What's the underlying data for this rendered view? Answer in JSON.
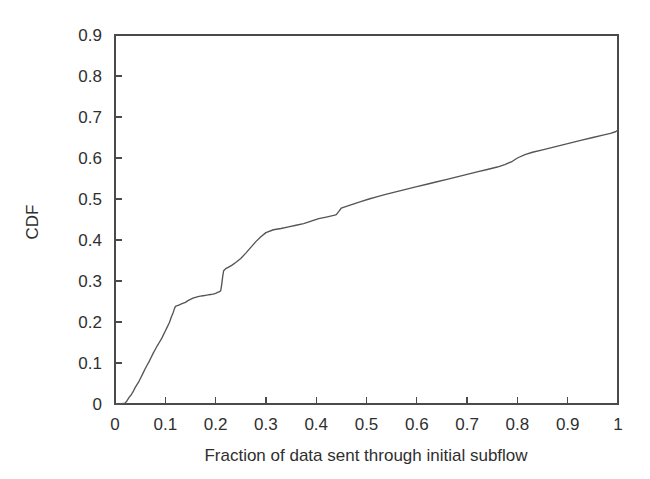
{
  "chart_data": {
    "type": "line",
    "title": "",
    "subtitle": "",
    "xlabel": "Fraction of data sent through initial subflow",
    "ylabel": "CDF",
    "xlim": [
      0,
      1
    ],
    "ylim": [
      0,
      0.9
    ],
    "grid": false,
    "legend": null,
    "legend_position": "none",
    "xticks": [
      0,
      0.1,
      0.2,
      0.3,
      0.4,
      0.5,
      0.6,
      0.7,
      0.8,
      0.9,
      1
    ],
    "xticklabels": [
      "0",
      "0.1",
      "0.2",
      "0.3",
      "0.4",
      "0.5",
      "0.6",
      "0.7",
      "0.8",
      "0.9",
      "1"
    ],
    "yticks": [
      0,
      0.1,
      0.2,
      0.3,
      0.4,
      0.5,
      0.6,
      0.7,
      0.8,
      0.9
    ],
    "yticklabels": [
      "0",
      "0.1",
      "0.2",
      "0.3",
      "0.4",
      "0.5",
      "0.6",
      "0.7",
      "0.8",
      "0.9"
    ],
    "series": [
      {
        "name": "CDF of fraction of data sent through initial subflow",
        "color": "#555555",
        "x": [
          0.0,
          0.01,
          0.02,
          0.024,
          0.028,
          0.032,
          0.036,
          0.04,
          0.044,
          0.048,
          0.052,
          0.056,
          0.06,
          0.064,
          0.068,
          0.072,
          0.076,
          0.08,
          0.084,
          0.088,
          0.092,
          0.096,
          0.1,
          0.104,
          0.108,
          0.112,
          0.116,
          0.118,
          0.12,
          0.124,
          0.128,
          0.132,
          0.136,
          0.14,
          0.145,
          0.15,
          0.155,
          0.16,
          0.165,
          0.17,
          0.175,
          0.18,
          0.185,
          0.19,
          0.195,
          0.2,
          0.204,
          0.208,
          0.21,
          0.212,
          0.214,
          0.216,
          0.22,
          0.226,
          0.232,
          0.24,
          0.25,
          0.26,
          0.27,
          0.28,
          0.29,
          0.3,
          0.315,
          0.33,
          0.345,
          0.36,
          0.375,
          0.39,
          0.405,
          0.42,
          0.435,
          0.44,
          0.445,
          0.45,
          0.46,
          0.475,
          0.49,
          0.505,
          0.52,
          0.54,
          0.56,
          0.58,
          0.6,
          0.62,
          0.64,
          0.66,
          0.68,
          0.7,
          0.72,
          0.74,
          0.76,
          0.775,
          0.79,
          0.8,
          0.815,
          0.83,
          0.85,
          0.87,
          0.89,
          0.91,
          0.93,
          0.95,
          0.97,
          0.985,
          0.995,
          1.0
        ],
        "y": [
          0.0,
          0.0,
          0.002,
          0.008,
          0.016,
          0.022,
          0.03,
          0.04,
          0.048,
          0.056,
          0.066,
          0.076,
          0.086,
          0.095,
          0.104,
          0.114,
          0.124,
          0.133,
          0.142,
          0.15,
          0.158,
          0.168,
          0.178,
          0.188,
          0.198,
          0.212,
          0.224,
          0.232,
          0.238,
          0.24,
          0.242,
          0.244,
          0.246,
          0.248,
          0.252,
          0.255,
          0.258,
          0.26,
          0.262,
          0.263,
          0.264,
          0.265,
          0.266,
          0.267,
          0.268,
          0.27,
          0.272,
          0.274,
          0.276,
          0.29,
          0.31,
          0.325,
          0.33,
          0.334,
          0.338,
          0.345,
          0.355,
          0.368,
          0.382,
          0.396,
          0.408,
          0.418,
          0.425,
          0.428,
          0.432,
          0.436,
          0.44,
          0.446,
          0.452,
          0.456,
          0.46,
          0.462,
          0.47,
          0.478,
          0.482,
          0.488,
          0.494,
          0.5,
          0.505,
          0.512,
          0.518,
          0.524,
          0.53,
          0.536,
          0.542,
          0.548,
          0.554,
          0.56,
          0.566,
          0.572,
          0.578,
          0.584,
          0.592,
          0.6,
          0.608,
          0.614,
          0.62,
          0.626,
          0.632,
          0.638,
          0.644,
          0.65,
          0.656,
          0.66,
          0.664,
          0.668
        ],
        "notes": "Monotone non-decreasing empirical CDF; flat near 0 until x~0.02, steep staircase rise to ~0.24 by x~0.12, short plateau to x~0.21, sharp jump to ~0.33, then gradual rise reaching ~0.67 at x=1."
      }
    ]
  },
  "axes": {
    "x_title": "Fraction of data sent through initial subflow",
    "y_title": "CDF"
  }
}
